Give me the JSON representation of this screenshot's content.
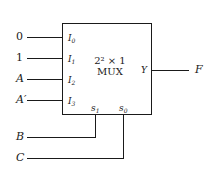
{
  "diagram": {
    "type": "multiplexer",
    "mux_label_line1": "2² × 1",
    "mux_label_line2": "MUX",
    "data_inputs": [
      {
        "signal": "0",
        "pin": "I",
        "pin_index": "0"
      },
      {
        "signal": "1",
        "pin": "I",
        "pin_index": "1"
      },
      {
        "signal": "A",
        "pin": "I",
        "pin_index": "2"
      },
      {
        "signal": "A′",
        "pin": "I",
        "pin_index": "3"
      }
    ],
    "select_inputs": [
      {
        "signal": "B",
        "pin": "s",
        "pin_index": "1"
      },
      {
        "signal": "C",
        "pin": "s",
        "pin_index": "0"
      }
    ],
    "output": {
      "pin": "Y",
      "signal": "F"
    }
  }
}
